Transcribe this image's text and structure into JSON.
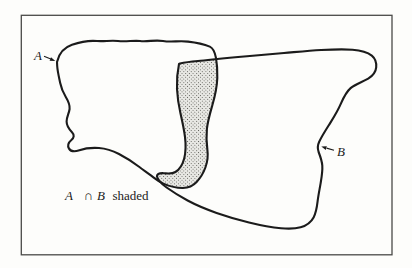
{
  "figure": {
    "set_a_label": "A",
    "set_b_label": "B",
    "caption": {
      "set_a": "A",
      "intersection_symbol": "∩",
      "set_b": "B",
      "suffix": "shaded"
    },
    "shading_style": "stipple",
    "colors": {
      "ink": "#1b1b1b",
      "frame": "#4a4a48",
      "shade_background": "#e8e8e4",
      "shade_dots": "#3c3c36",
      "paper": "#fdfdfb"
    }
  }
}
